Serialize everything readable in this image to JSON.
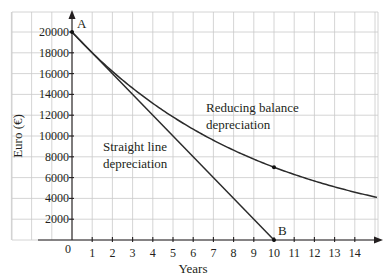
{
  "chart_data": {
    "type": "line",
    "title": "",
    "xlabel": "Years",
    "ylabel": "Euro (€)",
    "xlim": [
      0,
      15
    ],
    "ylim": [
      0,
      20000
    ],
    "x_ticks": [
      1,
      2,
      3,
      4,
      5,
      6,
      7,
      8,
      9,
      10,
      11,
      12,
      13,
      14
    ],
    "y_ticks": [
      2000,
      4000,
      6000,
      8000,
      10000,
      12000,
      14000,
      16000,
      18000,
      20000
    ],
    "y_tick_labels": [
      "2000",
      "4000",
      "6000",
      "8000",
      "10000",
      "12000",
      "14000",
      "16000",
      "18000",
      "20000"
    ],
    "origin_label": "0",
    "grid": true,
    "series": [
      {
        "name": "Straight line depreciation",
        "label_lines": [
          "Straight line",
          "depreciation"
        ],
        "x": [
          0,
          10
        ],
        "values": [
          20000,
          0
        ]
      },
      {
        "name": "Reducing balance depreciation",
        "label_lines": [
          "Reducing balance",
          "depreciation"
        ],
        "x": [
          0,
          1,
          2,
          3,
          4,
          5,
          6,
          7,
          8,
          9,
          10,
          11,
          12,
          13,
          14,
          15
        ],
        "values": [
          20000,
          18008,
          16214,
          14599,
          13145,
          11836,
          10657,
          9596,
          8640,
          7779,
          7000,
          6303,
          5675,
          5110,
          4601,
          4143
        ],
        "marked_point": {
          "x": 10,
          "y": 7000
        }
      }
    ],
    "points": [
      {
        "label": "A",
        "x": 0,
        "y": 20000
      },
      {
        "label": "B",
        "x": 10,
        "y": 0
      }
    ]
  }
}
